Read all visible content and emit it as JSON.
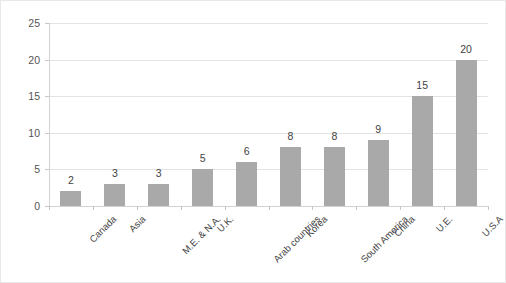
{
  "chart_data": {
    "type": "bar",
    "title": "",
    "subtitle": "",
    "xlabel": "",
    "ylabel": "",
    "categories": [
      "Canada",
      "Asia",
      "M.E. & N.A.",
      "U.K.",
      "Arab countries",
      "Korea",
      "South America",
      "China",
      "U.E.",
      "U.S.A"
    ],
    "values": [
      2,
      3,
      3,
      5,
      6,
      8,
      8,
      9,
      15,
      20
    ],
    "data_labels": [
      "2",
      "3",
      "3",
      "5",
      "6",
      "8",
      "8",
      "9",
      "15",
      "20"
    ],
    "ylim": [
      0,
      25
    ],
    "y_ticks": [
      0,
      5,
      10,
      15,
      20,
      25
    ],
    "y_tick_labels": [
      "0",
      "5",
      "10",
      "15",
      "20",
      "25"
    ],
    "grid": true,
    "grid_axis": "y",
    "legend": false,
    "legend_position": "none",
    "bar_color": "#a9a9a9",
    "gridline_color": "#e3e3e3",
    "axis_color": "#d2d2d2",
    "label_color": "#3f3f3f",
    "tick_label_color": "#555555",
    "background_color": "#ffffff",
    "x_tick_label_rotation": -45
  }
}
